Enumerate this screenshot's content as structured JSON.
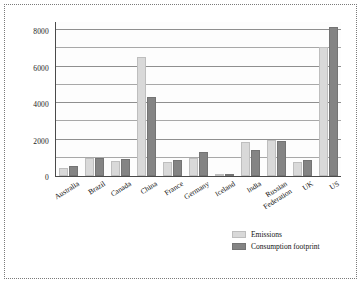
{
  "chart_data": {
    "type": "bar",
    "title": "",
    "subtitle": "",
    "xlabel": "",
    "ylabel": "millions of tonnes CO",
    "ylabel_sub": "2",
    "ylabel_suffix": "e",
    "categories": [
      "Australia",
      "Brazil",
      "Canada",
      "China",
      "France",
      "Germany",
      "Iceland",
      "India",
      "Russian\nFederation",
      "UK",
      "US"
    ],
    "series": [
      {
        "name": "Emissions",
        "color": "#d9d9d9",
        "values": [
          440,
          1000,
          830,
          6500,
          760,
          1000,
          10,
          1850,
          1950,
          760,
          7100
        ]
      },
      {
        "name": "Consumption footprint",
        "color": "#848484",
        "values": [
          530,
          980,
          910,
          4310,
          890,
          1300,
          15,
          1450,
          1900,
          890,
          8150
        ]
      }
    ],
    "ylim": [
      0,
      8500
    ],
    "yticks": [
      0,
      2000,
      4000,
      6000,
      8000
    ],
    "ytick_labels": [
      "0",
      "2000",
      "4000",
      "6000",
      "8000"
    ],
    "gridlines": [
      1000,
      2000,
      3000,
      4000,
      5000,
      6000,
      7000,
      8000
    ],
    "grid": true,
    "legend_position": "bottom-right"
  },
  "legend": {
    "items": [
      {
        "label": "Emissions",
        "color": "#d9d9d9"
      },
      {
        "label": "Consumption footprint",
        "label_line1": "Consumption",
        "label_line2": "footprint",
        "color": "#848484"
      }
    ]
  }
}
